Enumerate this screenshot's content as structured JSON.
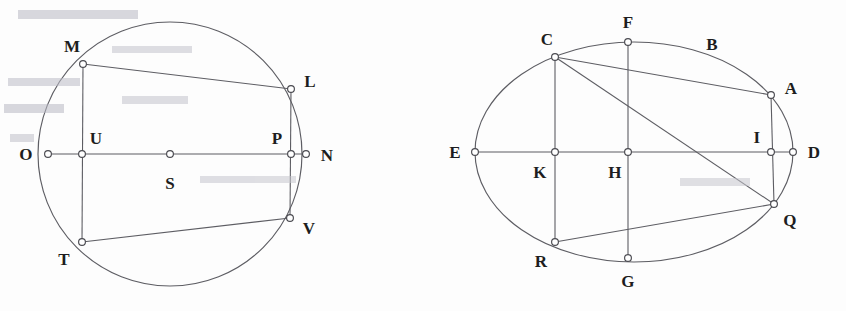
{
  "figure": {
    "background_color": "#fdfdfd",
    "stroke_color": "#5d5d63",
    "label_color": "#1d1d20",
    "node_fill": "#ffffff"
  },
  "left_figure": {
    "name": "circle-figure",
    "shape": "circle",
    "center": {
      "x": 170,
      "y": 154
    },
    "radius": 132,
    "center_point_label": "S",
    "diameter_endpoints": [
      "O",
      "N"
    ],
    "points": [
      {
        "id": "O",
        "label": "O",
        "x": 48,
        "y": 154,
        "label_x": 26,
        "label_y": 154,
        "on_curve": true
      },
      {
        "id": "U",
        "label": "U",
        "x": 82,
        "y": 154,
        "label_x": 96,
        "label_y": 138,
        "on_curve": false
      },
      {
        "id": "S",
        "label": "S",
        "x": 170,
        "y": 154,
        "label_x": 170,
        "label_y": 183,
        "on_curve": false
      },
      {
        "id": "P",
        "label": "P",
        "x": 291,
        "y": 154,
        "label_x": 277,
        "label_y": 138,
        "on_curve": false
      },
      {
        "id": "N",
        "label": "N",
        "x": 306,
        "y": 154,
        "label_x": 327,
        "label_y": 155,
        "on_curve": true
      },
      {
        "id": "M",
        "label": "M",
        "x": 83,
        "y": 64,
        "label_x": 72,
        "label_y": 46,
        "on_curve": true
      },
      {
        "id": "L",
        "label": "L",
        "x": 291,
        "y": 89,
        "label_x": 310,
        "label_y": 81,
        "on_curve": true
      },
      {
        "id": "T",
        "label": "T",
        "x": 82,
        "y": 242,
        "label_x": 64,
        "label_y": 259,
        "on_curve": true
      },
      {
        "id": "V",
        "label": "V",
        "x": 290,
        "y": 218,
        "label_x": 309,
        "label_y": 228,
        "on_curve": true
      }
    ],
    "segments": [
      {
        "from": "O",
        "to": "N",
        "kind": "diameter"
      },
      {
        "from": "M",
        "to": "L",
        "kind": "chord"
      },
      {
        "from": "T",
        "to": "V",
        "kind": "chord"
      },
      {
        "from": "M",
        "to": "T",
        "kind": "chord"
      },
      {
        "from": "L",
        "to": "V",
        "kind": "chord"
      }
    ]
  },
  "right_figure": {
    "name": "ellipse-figure",
    "shape": "ellipse",
    "center": {
      "x": 634,
      "y": 152
    },
    "radius_x": 159,
    "radius_y": 110,
    "major_axis_endpoints": [
      "E",
      "D"
    ],
    "points": [
      {
        "id": "E",
        "label": "E",
        "x": 475,
        "y": 152,
        "label_x": 455,
        "label_y": 152,
        "on_curve": true
      },
      {
        "id": "K",
        "label": "K",
        "x": 555,
        "y": 152,
        "label_x": 540,
        "label_y": 172,
        "on_curve": false
      },
      {
        "id": "H",
        "label": "H",
        "x": 628,
        "y": 152,
        "label_x": 615,
        "label_y": 172,
        "on_curve": false
      },
      {
        "id": "I",
        "label": "I",
        "x": 771,
        "y": 152,
        "label_x": 757,
        "label_y": 137,
        "on_curve": false
      },
      {
        "id": "D",
        "label": "D",
        "x": 793,
        "y": 152,
        "label_x": 814,
        "label_y": 152,
        "on_curve": true
      },
      {
        "id": "C",
        "label": "C",
        "x": 555,
        "y": 57,
        "label_x": 547,
        "label_y": 39,
        "on_curve": true
      },
      {
        "id": "F",
        "label": "F",
        "x": 628,
        "y": 42,
        "label_x": 628,
        "label_y": 22,
        "on_curve": true
      },
      {
        "id": "B",
        "label": "B",
        "x": 712,
        "y": 60,
        "label_x": 712,
        "label_y": 44,
        "on_curve": true,
        "marker": false
      },
      {
        "id": "A",
        "label": "A",
        "x": 771,
        "y": 95,
        "label_x": 791,
        "label_y": 88,
        "on_curve": true
      },
      {
        "id": "Q",
        "label": "Q",
        "x": 774,
        "y": 204,
        "label_x": 790,
        "label_y": 220,
        "on_curve": true
      },
      {
        "id": "R",
        "label": "R",
        "x": 555,
        "y": 242,
        "label_x": 541,
        "label_y": 261,
        "on_curve": true
      },
      {
        "id": "G",
        "label": "G",
        "x": 628,
        "y": 258,
        "label_x": 628,
        "label_y": 281,
        "on_curve": true
      }
    ],
    "segments": [
      {
        "from": "E",
        "to": "D",
        "kind": "major-axis"
      },
      {
        "from": "C",
        "to": "R",
        "kind": "chord"
      },
      {
        "from": "F",
        "to": "G",
        "kind": "chord"
      },
      {
        "from": "A",
        "to": "Q",
        "kind": "chord"
      },
      {
        "from": "C",
        "to": "A",
        "kind": "chord"
      },
      {
        "from": "C",
        "to": "Q",
        "kind": "chord"
      },
      {
        "from": "R",
        "to": "Q",
        "kind": "chord"
      }
    ]
  }
}
